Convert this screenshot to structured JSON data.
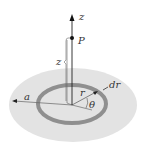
{
  "diagram": {
    "labels": {
      "z_axis": "z",
      "point": "P",
      "height": "z",
      "radius_disk": "a",
      "ring_radius": "r",
      "ring_width": "dr",
      "angle": "θ"
    },
    "colors": {
      "disk_fill": "#e3e3e3",
      "ring": "#8f8f8f",
      "lines": "#555555",
      "axis": "#222222"
    }
  }
}
